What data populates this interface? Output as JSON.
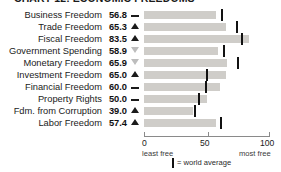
{
  "title": "CHART 12: ECONOMIC FREEDOMS",
  "legend": {
    "marker_name": "world-average-tick",
    "text": "= world average"
  },
  "axis": {
    "ticks": [
      "0",
      "50",
      "100"
    ],
    "left_caption": "least free",
    "right_caption": "most free"
  },
  "chart_data": {
    "type": "bar",
    "orientation": "horizontal",
    "title": "CHART 12: ECONOMIC FREEDOMS",
    "xlabel": "",
    "ylabel": "",
    "xlim": [
      0,
      100
    ],
    "xticks": [
      0,
      50,
      100
    ],
    "grid": false,
    "legend_position": "bottom",
    "bar_color": "#cfcdc9",
    "marker_color": "#121212",
    "categories": [
      "Business Freedom",
      "Trade Freedom",
      "Fiscal Freedom",
      "Government Spending",
      "Monetary Freedom",
      "Investment Freedom",
      "Financial Freedom",
      "Property Rights",
      "Fdm. from Corruption",
      "Labor Freedom"
    ],
    "series": [
      {
        "name": "Country score",
        "values": [
          56.8,
          65.3,
          83.5,
          58.9,
          65.9,
          65.0,
          60.0,
          50.0,
          39.0,
          57.4
        ]
      },
      {
        "name": "World average",
        "values": [
          62.0,
          74.0,
          77.5,
          63.5,
          74.5,
          50.0,
          49.0,
          43.5,
          40.5,
          61.5
        ]
      }
    ],
    "trends": [
      "flat",
      "up",
      "up",
      "down",
      "down",
      "up",
      "flat",
      "flat",
      "up",
      "up"
    ]
  },
  "rows": [
    {
      "label": "Business Freedom",
      "value": "56.8",
      "trend": "flat",
      "score": 56.8,
      "avg": 62.0
    },
    {
      "label": "Trade Freedom",
      "value": "65.3",
      "trend": "up",
      "score": 65.3,
      "avg": 74.0
    },
    {
      "label": "Fiscal Freedom",
      "value": "83.5",
      "trend": "up",
      "score": 83.5,
      "avg": 77.5
    },
    {
      "label": "Government Spending",
      "value": "58.9",
      "trend": "down",
      "score": 58.9,
      "avg": 63.5
    },
    {
      "label": "Monetary Freedom",
      "value": "65.9",
      "trend": "down",
      "score": 65.9,
      "avg": 74.5
    },
    {
      "label": "Investment Freedom",
      "value": "65.0",
      "trend": "up",
      "score": 65.0,
      "avg": 50.0
    },
    {
      "label": "Financial Freedom",
      "value": "60.0",
      "trend": "flat",
      "score": 60.0,
      "avg": 49.0
    },
    {
      "label": "Property Rights",
      "value": "50.0",
      "trend": "flat",
      "score": 50.0,
      "avg": 43.5
    },
    {
      "label": "Fdm. from Corruption",
      "value": "39.0",
      "trend": "up",
      "score": 39.0,
      "avg": 40.5
    },
    {
      "label": "Labor Freedom",
      "value": "57.4",
      "trend": "up",
      "score": 57.4,
      "avg": 61.5
    }
  ]
}
